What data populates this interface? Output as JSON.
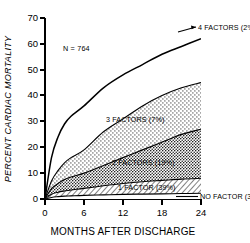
{
  "chart_data": {
    "type": "area",
    "title": "",
    "subtitle": "",
    "xlabel": "MONTHS AFTER DISCHARGE",
    "ylabel": "PERCENT CARDIAC MORTALITY",
    "xlim": [
      0,
      24
    ],
    "ylim": [
      0,
      70
    ],
    "xticks": [
      0,
      6,
      12,
      18,
      24
    ],
    "yticks": [
      0,
      10,
      20,
      30,
      40,
      50,
      60,
      70
    ],
    "grid": false,
    "legend_position": "inline-annotations",
    "annotations": [
      {
        "text": "N = 764",
        "x": 6.5,
        "y": 52
      }
    ],
    "x": [
      0,
      1,
      2,
      3,
      4,
      6,
      9,
      12,
      15,
      18,
      21,
      24
    ],
    "series": [
      {
        "name": "4 FACTORS (2%)",
        "label": "4 FACTORS",
        "percent_of_cohort": "2%",
        "style": "line",
        "values": [
          0,
          16,
          24,
          29,
          32,
          36,
          43,
          48,
          52,
          56,
          59,
          62
        ]
      },
      {
        "name": "3 FACTORS (7%)",
        "label": "3 FACTORS",
        "percent_of_cohort": "7%",
        "style": "stipple-light",
        "values": [
          0,
          7,
          11,
          14,
          16,
          19,
          26,
          31,
          36,
          40,
          43,
          45
        ]
      },
      {
        "name": "2 FACTORS (19%)",
        "label": "2 FACTORS",
        "percent_of_cohort": "19%",
        "style": "stipple-dark",
        "values": [
          0,
          4,
          6,
          7.5,
          8.5,
          10,
          13,
          16,
          19,
          22,
          25,
          27
        ]
      },
      {
        "name": "1 FACTOR (39%)",
        "label": "1 FACTOR",
        "percent_of_cohort": "39%",
        "style": "hatch",
        "values": [
          0,
          1.8,
          2.6,
          3.1,
          3.5,
          4.1,
          5.1,
          6.0,
          6.7,
          7.2,
          7.7,
          8.0
        ]
      },
      {
        "name": "NO FACTOR (33%)",
        "label": "NO FACTOR",
        "percent_of_cohort": "33%",
        "style": "line-flat",
        "values": [
          0,
          0.6,
          0.9,
          1.1,
          1.2,
          1.4,
          1.6,
          1.8,
          1.9,
          2.0,
          2.1,
          2.2
        ]
      }
    ]
  },
  "labels": {
    "four_factors": "4 FACTORS (2%)",
    "three_factors": "3 FACTORS (7%)",
    "two_factors": "2 FACTORS (19%)",
    "one_factor": "1 FACTOR (39%)",
    "no_factor": "NO FACTOR (33%)",
    "n_label": "N = 764",
    "x_title": "MONTHS AFTER DISCHARGE",
    "y_title": "PERCENT CARDIAC MORTALITY"
  },
  "ticks": {
    "y": [
      "0",
      "10",
      "20",
      "30",
      "40",
      "50",
      "60",
      "70"
    ],
    "x": [
      "0",
      "6",
      "12",
      "18",
      "24"
    ]
  },
  "colors": {
    "ink": "#000000",
    "background": "#ffffff"
  }
}
